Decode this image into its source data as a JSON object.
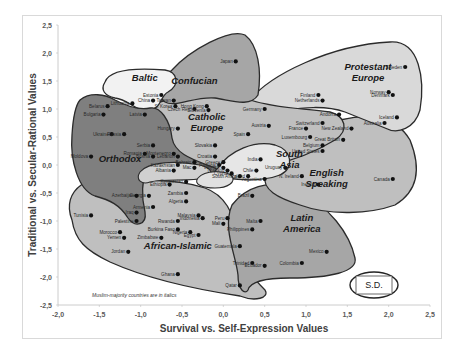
{
  "chart_data": {
    "type": "scatter",
    "title": "",
    "xlabel": "Survival vs. Self-Expression Values",
    "ylabel": "Traditional vs. Secular-Rational Values",
    "xlim": [
      -2.0,
      2.5
    ],
    "ylim": [
      -2.5,
      2.5
    ],
    "x_ticks": [
      "-2,0",
      "-1,5",
      "-1,0",
      "-0,5",
      "0,0",
      "0,5",
      "1,0",
      "1,5",
      "2,0",
      "2,5"
    ],
    "y_ticks": [
      "2,5",
      "2,0",
      "1,5",
      "1,0",
      "0,5",
      "0,0",
      "-0,5",
      "-1,0",
      "-1,5",
      "-2,0",
      "-2,5"
    ],
    "grid": false,
    "note": "Muslim-majority countries are in italics",
    "sd_box": "S.D.",
    "regions": [
      {
        "name": "Baltic",
        "label_x": -0.95,
        "label_y": 1.5,
        "color": "#f2f2f2"
      },
      {
        "name": "Confucian",
        "label_x": -0.35,
        "label_y": 1.45,
        "color": "#a6a6a6"
      },
      {
        "name": "Protestant Europe",
        "label_x": 1.75,
        "label_y": 1.6,
        "color": "#d9d9d9"
      },
      {
        "name": "Catholic Europe",
        "label_x": -0.2,
        "label_y": 0.7,
        "color": "#bfbfbf"
      },
      {
        "name": "Orthodox",
        "label_x": -1.25,
        "label_y": 0.05,
        "color": "#7f7f7f"
      },
      {
        "name": "South Asia",
        "label_x": 0.8,
        "label_y": 0.05,
        "color": "#e6e6e6"
      },
      {
        "name": "English Speaking",
        "label_x": 1.25,
        "label_y": -0.3,
        "color": "#bfbfbf"
      },
      {
        "name": "Latin America",
        "label_x": 0.95,
        "label_y": -1.1,
        "color": "#a6a6a6"
      },
      {
        "name": "African-Islamic",
        "label_x": -0.55,
        "label_y": -1.5,
        "color": "#bfbfbf"
      }
    ],
    "points": [
      {
        "name": "Japan",
        "x": 0.15,
        "y": 1.85
      },
      {
        "name": "Estonia",
        "x": -0.75,
        "y": 1.25
      },
      {
        "name": "Lithuania",
        "x": -1.1,
        "y": 1.1
      },
      {
        "name": "Latvia",
        "x": -0.95,
        "y": 0.9
      },
      {
        "name": "Taiwan",
        "x": -0.6,
        "y": 1.15
      },
      {
        "name": "S. Korea",
        "x": -0.58,
        "y": 1.05
      },
      {
        "name": "China",
        "x": -0.85,
        "y": 1.15
      },
      {
        "name": "Hong Kong",
        "x": -0.2,
        "y": 1.05
      },
      {
        "name": "Czech Rep.",
        "x": -0.35,
        "y": 1.0
      },
      {
        "name": "Slovenia",
        "x": -0.18,
        "y": 0.98
      },
      {
        "name": "Belarus",
        "x": -1.4,
        "y": 1.05
      },
      {
        "name": "Bulgaria",
        "x": -1.45,
        "y": 0.9
      },
      {
        "name": "Ukraine",
        "x": -1.35,
        "y": 0.55
      },
      {
        "name": "Russia",
        "x": -1.2,
        "y": 0.55
      },
      {
        "name": "Hungary",
        "x": -0.55,
        "y": 0.65
      },
      {
        "name": "Serbia",
        "x": -0.85,
        "y": 0.35
      },
      {
        "name": "Montenegro",
        "x": -0.6,
        "y": 0.2
      },
      {
        "name": "Moldova",
        "x": -1.6,
        "y": 0.15
      },
      {
        "name": "Romania",
        "x": -0.95,
        "y": 0.2
      },
      {
        "name": "Bosnia",
        "x": -0.85,
        "y": 0.15
      },
      {
        "name": "Slovakia",
        "x": -0.1,
        "y": 0.35
      },
      {
        "name": "Croatia",
        "x": -0.1,
        "y": 0.15
      },
      {
        "name": "Greece",
        "x": 0.0,
        "y": 0.05
      },
      {
        "name": "Portugal",
        "x": -0.05,
        "y": 0.0
      },
      {
        "name": "Germany",
        "x": 0.5,
        "y": 1.0
      },
      {
        "name": "Austria",
        "x": 0.55,
        "y": 0.7
      },
      {
        "name": "Spain",
        "x": 0.3,
        "y": 0.55
      },
      {
        "name": "France",
        "x": 1.0,
        "y": 0.65
      },
      {
        "name": "Luxembourg",
        "x": 1.05,
        "y": 0.5
      },
      {
        "name": "Belgium",
        "x": 1.2,
        "y": 0.35
      },
      {
        "name": "Andorra",
        "x": 1.4,
        "y": 0.9
      },
      {
        "name": "Switzerland",
        "x": 1.2,
        "y": 0.75
      },
      {
        "name": "Sweden",
        "x": 2.2,
        "y": 1.75
      },
      {
        "name": "Finland",
        "x": 1.15,
        "y": 1.25
      },
      {
        "name": "Netherlands",
        "x": 1.2,
        "y": 1.15
      },
      {
        "name": "Norway",
        "x": 2.0,
        "y": 1.3
      },
      {
        "name": "Denmark",
        "x": 2.05,
        "y": 1.25
      },
      {
        "name": "Iceland",
        "x": 2.1,
        "y": 0.85
      },
      {
        "name": "Australia",
        "x": 1.95,
        "y": 0.75
      },
      {
        "name": "New Zealand",
        "x": 1.55,
        "y": 0.65
      },
      {
        "name": "Great Britain",
        "x": 1.45,
        "y": 0.45
      },
      {
        "name": "United States",
        "x": 1.2,
        "y": 0.25
      },
      {
        "name": "Canada",
        "x": 2.05,
        "y": -0.25
      },
      {
        "name": "Ireland",
        "x": 1.15,
        "y": -0.35
      },
      {
        "name": "N. Ireland",
        "x": 0.95,
        "y": -0.2
      },
      {
        "name": "India",
        "x": 0.45,
        "y": 0.1
      },
      {
        "name": "Uruguay",
        "x": 0.75,
        "y": -0.05
      },
      {
        "name": "Chile",
        "x": 0.4,
        "y": -0.1
      },
      {
        "name": "Argentina",
        "x": 0.5,
        "y": -0.25
      },
      {
        "name": "Poland",
        "x": 0.3,
        "y": -0.2
      },
      {
        "name": "Lebanon",
        "x": -0.55,
        "y": 0.15
      },
      {
        "name": "Bahrain",
        "x": -0.35,
        "y": 0.05
      },
      {
        "name": "Mac",
        "x": -0.35,
        "y": -0.05
      },
      {
        "name": "Kazakhstan",
        "x": -0.55,
        "y": 0.0
      },
      {
        "name": "Albania",
        "x": -0.6,
        "y": -0.1
      },
      {
        "name": "Vietnam",
        "x": 0.0,
        "y": -0.05
      },
      {
        "name": "Thailand",
        "x": 0.05,
        "y": -0.1
      },
      {
        "name": "Cyprus",
        "x": 0.1,
        "y": -0.15
      },
      {
        "name": "South Africa",
        "x": 0.2,
        "y": -0.2
      },
      {
        "name": "Kyrgyzstan",
        "x": -0.45,
        "y": -0.3
      },
      {
        "name": "Georgia",
        "x": -0.9,
        "y": -0.55
      },
      {
        "name": "Armenia",
        "x": -0.85,
        "y": -0.75
      },
      {
        "name": "Azerbaijan",
        "x": -1.05,
        "y": -0.55
      },
      {
        "name": "Ethiopia",
        "x": -0.65,
        "y": -0.35
      },
      {
        "name": "Zambia",
        "x": -0.45,
        "y": -0.5
      },
      {
        "name": "Algeria",
        "x": -0.45,
        "y": -0.65
      },
      {
        "name": "Tunisia",
        "x": -1.6,
        "y": -0.9
      },
      {
        "name": "Iraq",
        "x": -1.05,
        "y": -0.85
      },
      {
        "name": "Palestine",
        "x": -1.05,
        "y": -1.0
      },
      {
        "name": "Morocco",
        "x": -1.25,
        "y": -1.2
      },
      {
        "name": "Yemen",
        "x": -1.2,
        "y": -1.3
      },
      {
        "name": "Jordan",
        "x": -1.15,
        "y": -1.55
      },
      {
        "name": "Malaysia",
        "x": -0.3,
        "y": -0.9
      },
      {
        "name": "Rwanda",
        "x": -0.55,
        "y": -1.0
      },
      {
        "name": "Burkina Faso",
        "x": -0.55,
        "y": -1.15
      },
      {
        "name": "Indonesia",
        "x": -0.25,
        "y": -0.95
      },
      {
        "name": "Nigeria",
        "x": -0.4,
        "y": -1.2
      },
      {
        "name": "Zimbabwe",
        "x": -0.75,
        "y": -1.3
      },
      {
        "name": "Mali",
        "x": 0.0,
        "y": -1.05
      },
      {
        "name": "Egypt",
        "x": -0.3,
        "y": -1.25
      },
      {
        "name": "Peru",
        "x": 0.05,
        "y": -0.95
      },
      {
        "name": "Brazil",
        "x": 0.35,
        "y": -0.55
      },
      {
        "name": "Malta",
        "x": 0.45,
        "y": -1.0
      },
      {
        "name": "Philippines",
        "x": 0.35,
        "y": -1.15
      },
      {
        "name": "Guatemala",
        "x": 0.2,
        "y": -1.45
      },
      {
        "name": "Trinidad",
        "x": 0.35,
        "y": -1.75
      },
      {
        "name": "Ecuador",
        "x": 0.5,
        "y": -1.8
      },
      {
        "name": "Colombia",
        "x": 0.95,
        "y": -1.75
      },
      {
        "name": "Mexico",
        "x": 1.25,
        "y": -1.55
      },
      {
        "name": "Ghana",
        "x": -0.55,
        "y": -1.95
      },
      {
        "name": "Qatar",
        "x": 0.2,
        "y": -2.15
      }
    ]
  }
}
